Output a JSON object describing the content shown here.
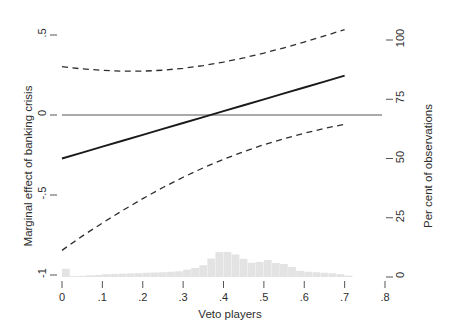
{
  "chart_data": {
    "type": "line",
    "title": "",
    "xlabel": "Veto players",
    "ylabel": "Marginal effect of banking crisis",
    "ylabel_right": "Per cent of observations",
    "xlim": [
      0,
      0.8
    ],
    "ylim": [
      -1,
      0.5
    ],
    "ylim_right": [
      0,
      100
    ],
    "grid": false,
    "legend": "none",
    "xticks": [
      "0",
      ".1",
      ".2",
      ".3",
      ".4",
      ".5",
      ".6",
      ".7",
      ".8"
    ],
    "xtick_values": [
      0,
      0.1,
      0.2,
      0.3,
      0.4,
      0.5,
      0.6,
      0.7,
      0.8
    ],
    "yticks_left": [
      ".5",
      "0",
      "-.5",
      "-1"
    ],
    "ytick_values_left": [
      0.5,
      0,
      -0.5,
      -1
    ],
    "yticks_right": [
      "0",
      "25",
      "50",
      "75",
      "100"
    ],
    "ytick_values_right": [
      0,
      25,
      50,
      75,
      100
    ],
    "zero_line": 0,
    "x": [
      0.0,
      0.05,
      0.1,
      0.15,
      0.2,
      0.25,
      0.3,
      0.35,
      0.4,
      0.45,
      0.5,
      0.55,
      0.6,
      0.65,
      0.7
    ],
    "series": [
      {
        "name": "Marginal effect",
        "style": "solid",
        "color": "#1a1a1a",
        "values": [
          -0.272,
          -0.235,
          -0.198,
          -0.161,
          -0.124,
          -0.087,
          -0.05,
          -0.013,
          0.024,
          0.061,
          0.098,
          0.135,
          0.172,
          0.209,
          0.246
        ]
      },
      {
        "name": "Upper 95% confidence interval",
        "style": "dashed",
        "color": "#2e2e2e",
        "values": [
          0.302,
          0.288,
          0.279,
          0.274,
          0.274,
          0.28,
          0.292,
          0.309,
          0.331,
          0.357,
          0.387,
          0.42,
          0.456,
          0.494,
          0.534
        ]
      },
      {
        "name": "Lower 95% confidence interval",
        "style": "dashed",
        "color": "#2e2e2e",
        "values": [
          -0.846,
          -0.757,
          -0.675,
          -0.597,
          -0.523,
          -0.453,
          -0.389,
          -0.33,
          -0.277,
          -0.229,
          -0.186,
          -0.148,
          -0.114,
          -0.084,
          -0.058
        ]
      }
    ],
    "histogram": {
      "name": "Distribution of observations",
      "color": "#e3e3e3",
      "axis": "right",
      "bin_width": 0.02,
      "bin_starts": [
        0.0,
        0.02,
        0.04,
        0.06,
        0.08,
        0.1,
        0.12,
        0.14,
        0.16,
        0.18,
        0.2,
        0.22,
        0.24,
        0.26,
        0.28,
        0.3,
        0.32,
        0.34,
        0.36,
        0.38,
        0.4,
        0.42,
        0.44,
        0.46,
        0.48,
        0.5,
        0.52,
        0.54,
        0.56,
        0.58,
        0.6,
        0.62,
        0.64,
        0.66,
        0.68,
        0.7
      ],
      "values": [
        3.5,
        0.4,
        0.5,
        0.7,
        0.9,
        1.2,
        1.3,
        1.4,
        1.5,
        1.6,
        1.8,
        1.9,
        2.0,
        2.2,
        2.4,
        3.1,
        3.8,
        5.0,
        7.8,
        10.5,
        10.6,
        9.5,
        7.7,
        6.0,
        6.4,
        7.2,
        5.9,
        5.5,
        4.2,
        2.6,
        2.2,
        2.0,
        1.8,
        1.6,
        1.2,
        0.6
      ]
    }
  }
}
